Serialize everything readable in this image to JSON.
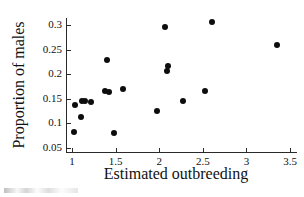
{
  "chart_data": {
    "type": "scatter",
    "title": "",
    "xlabel": "Estimated outbreeding",
    "ylabel": "Proportion of males",
    "xlim": [
      0.85,
      3.6
    ],
    "ylim": [
      0.05,
      0.32
    ],
    "xticks": [
      "1",
      "1.5",
      "2",
      "2.5",
      "3",
      "3.5"
    ],
    "xtick_values": [
      1,
      1.5,
      2,
      2.5,
      3,
      3.5
    ],
    "yticks": [
      "0.05",
      "0.1",
      "0.15",
      "0.2",
      "0.25",
      "0.3"
    ],
    "ytick_values": [
      0.05,
      0.1,
      0.15,
      0.2,
      0.25,
      0.3
    ],
    "grid": false,
    "legend": null,
    "marker": "filled-circle",
    "marker_color": "#0d0d0d",
    "points": [
      {
        "x": 1.02,
        "y": 0.082
      },
      {
        "x": 1.03,
        "y": 0.138
      },
      {
        "x": 1.1,
        "y": 0.112
      },
      {
        "x": 1.12,
        "y": 0.146
      },
      {
        "x": 1.15,
        "y": 0.145
      },
      {
        "x": 1.22,
        "y": 0.143
      },
      {
        "x": 1.38,
        "y": 0.165
      },
      {
        "x": 1.4,
        "y": 0.228
      },
      {
        "x": 1.42,
        "y": 0.164
      },
      {
        "x": 1.48,
        "y": 0.08
      },
      {
        "x": 1.58,
        "y": 0.169
      },
      {
        "x": 1.97,
        "y": 0.126
      },
      {
        "x": 2.07,
        "y": 0.295
      },
      {
        "x": 2.09,
        "y": 0.206
      },
      {
        "x": 2.1,
        "y": 0.216
      },
      {
        "x": 2.27,
        "y": 0.145
      },
      {
        "x": 2.53,
        "y": 0.165
      },
      {
        "x": 2.6,
        "y": 0.307
      },
      {
        "x": 3.35,
        "y": 0.259
      }
    ]
  },
  "caption": {
    "fragment": ""
  }
}
